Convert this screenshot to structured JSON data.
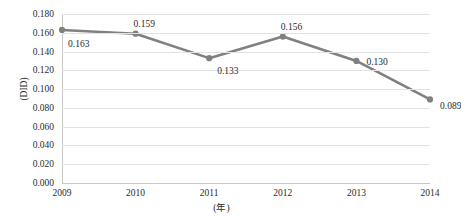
{
  "chart_data": {
    "type": "line",
    "title": "",
    "subtitle": "",
    "xlabel": "(年)",
    "ylabel": "(DID)",
    "categories": [
      "2009",
      "2010",
      "2011",
      "2012",
      "2013",
      "2014"
    ],
    "x": [
      2009,
      2010,
      2011,
      2012,
      2013,
      2014
    ],
    "values": [
      0.163,
      0.159,
      0.133,
      0.156,
      0.13,
      0.089
    ],
    "point_labels": [
      "0.163",
      "0.159",
      "0.133",
      "0.156",
      "0.130",
      "0.089"
    ],
    "series": [
      {
        "name": "DID",
        "values": [
          0.163,
          0.159,
          0.133,
          0.156,
          0.13,
          0.089
        ]
      }
    ],
    "ylim": [
      0.0,
      0.18
    ],
    "ytick_step": 0.02,
    "ytick_labels": [
      "0.180",
      "0.160",
      "0.140",
      "0.120",
      "0.100",
      "0.080",
      "0.060",
      "0.040",
      "0.020",
      "0.000"
    ],
    "ytick_values": [
      0.18,
      0.16,
      0.14,
      0.12,
      0.1,
      0.08,
      0.06,
      0.04,
      0.02,
      0.0
    ],
    "grid": true,
    "grid_axis": "y",
    "legend": false,
    "legend_position": "none",
    "marker": "circle",
    "colors": {
      "line": "#808080",
      "marker": "#808080",
      "grid": "#e2e2e2",
      "axis": "#c8c8c8",
      "text": "#2b2b2b",
      "background": "#ffffff"
    },
    "label_offsets": [
      {
        "dx": 6,
        "dy": 9
      },
      {
        "dx": -2,
        "dy": -15
      },
      {
        "dx": 8,
        "dy": 8
      },
      {
        "dx": -2,
        "dy": -15
      },
      {
        "dx": 10,
        "dy": -4
      },
      {
        "dx": 10,
        "dy": 2
      }
    ]
  }
}
